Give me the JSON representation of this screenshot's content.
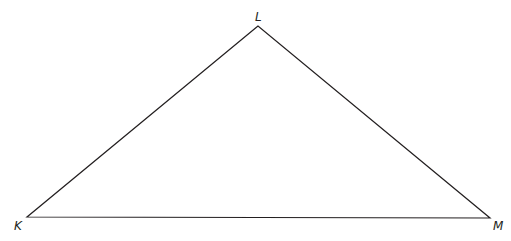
{
  "diagram": {
    "type": "triangle",
    "vertices": [
      {
        "label": "L",
        "x": 258,
        "y": 26,
        "label_x": 255,
        "label_y": 21
      },
      {
        "label": "K",
        "x": 27,
        "y": 217,
        "label_x": 14,
        "label_y": 230
      },
      {
        "label": "M",
        "x": 490,
        "y": 218,
        "label_x": 493,
        "label_y": 230
      }
    ],
    "stroke_color": "#231f20"
  }
}
